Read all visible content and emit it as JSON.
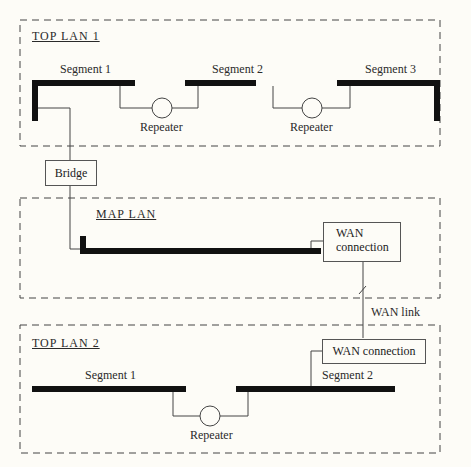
{
  "diagram": {
    "top_lan_1": {
      "title": "TOP LAN 1",
      "segments": [
        "Segment 1",
        "Segment 2",
        "Segment 3"
      ],
      "repeaters": [
        "Repeater",
        "Repeater"
      ]
    },
    "bridge": {
      "label": "Bridge"
    },
    "map_lan": {
      "title": "MAP LAN",
      "wan_connection": {
        "line1": "WAN",
        "line2": "connection"
      }
    },
    "wan_link": {
      "label": "WAN link"
    },
    "top_lan_2": {
      "title": "TOP LAN 2",
      "segments": [
        "Segment 1",
        "Segment 2"
      ],
      "repeaters": [
        "Repeater"
      ],
      "wan_connection": "WAN connection"
    }
  }
}
